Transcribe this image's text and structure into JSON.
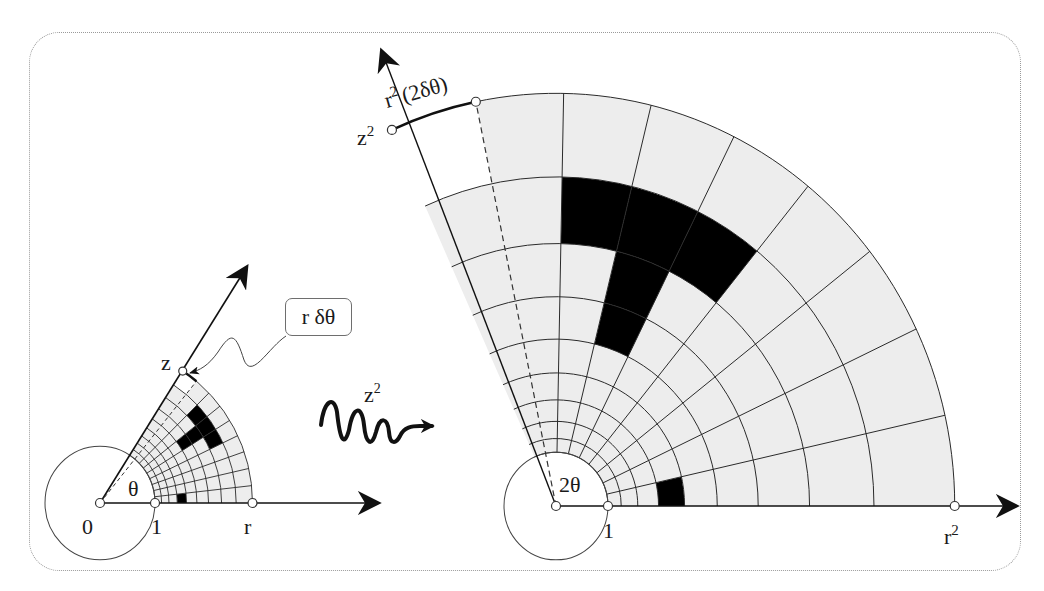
{
  "figure": {
    "colors": {
      "background": "#ffffff",
      "cell_fill": "#ededed",
      "cell_black": "#000000",
      "cell_white": "#ffffff",
      "grid_line": "#2a2a2a",
      "frame": "#9a9a9a"
    },
    "grid": {
      "bands": 9,
      "sectors": 9,
      "black_cells": [
        {
          "band": 7,
          "sector": 4
        },
        {
          "band": 7,
          "sector": 5
        },
        {
          "band": 7,
          "sector": 6
        },
        {
          "band": 6,
          "sector": 5
        },
        {
          "band": 5,
          "sector": 5
        },
        {
          "band": 3,
          "sector": 0
        }
      ],
      "white_cells": [
        {
          "band": 8,
          "sector": 8
        }
      ]
    },
    "source_plane": {
      "origin": [
        100,
        503
      ],
      "unit_px": 55,
      "y_scale": 1.03,
      "radial_factor": 1.12,
      "sector_deg": 6.35,
      "axis_end": [
        377,
        503
      ],
      "ray_end": [
        246,
        268
      ],
      "labels": {
        "origin": "0",
        "unit": "1",
        "radius": "r",
        "angle": "θ",
        "corner": "z"
      }
    },
    "target_plane": {
      "origin": [
        556,
        506
      ],
      "unit_px": 52,
      "y_scale": 1.035,
      "radial_factor": 1.254,
      "sector_deg": 12.7,
      "axis_end": [
        1015,
        506
      ],
      "ray_end": [
        382,
        52
      ],
      "labels": {
        "unit": "1",
        "radius": "r",
        "radius_sup": "2",
        "angle": "2θ",
        "corner": "z",
        "corner_sup": "2",
        "arc": "r",
        "arc_sup": "2",
        "arc_rest": "(2δθ)"
      }
    },
    "callout": {
      "label": "r δθ"
    },
    "map_arrow": {
      "label": "z",
      "label_sup": "2"
    }
  }
}
